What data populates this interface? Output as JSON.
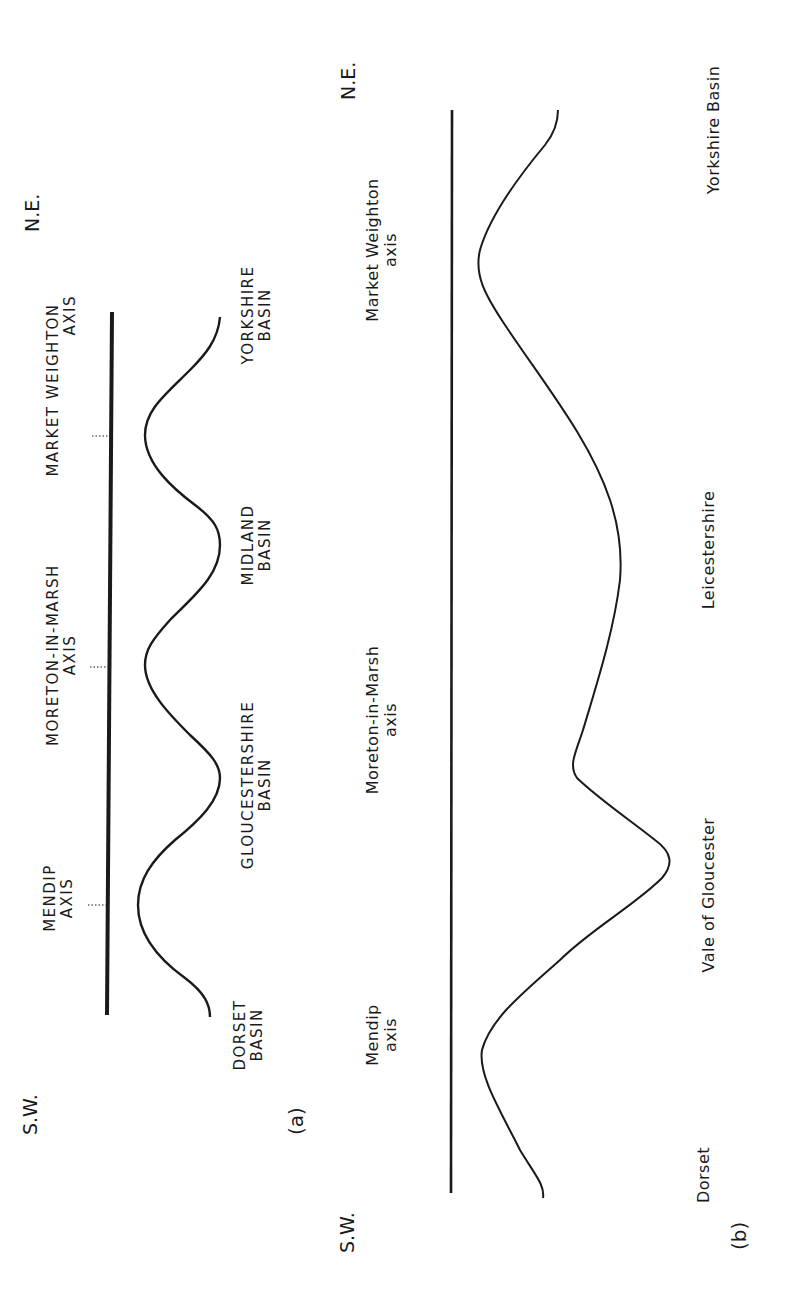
{
  "panel_a": {
    "label": "(a)",
    "sw": "S.W.",
    "ne": "N.E.",
    "axes": [
      {
        "line1": "MENDIP",
        "line2": "AXIS"
      },
      {
        "line1": "MORETON-IN-MARSH",
        "line2": "AXIS"
      },
      {
        "line1": "MARKET WEIGHTON",
        "line2": "AXIS"
      }
    ],
    "basins": [
      {
        "line1": "DORSET",
        "line2": "BASIN"
      },
      {
        "line1": "GLOUCESTERSHIRE",
        "line2": "BASIN"
      },
      {
        "line1": "MIDLAND",
        "line2": "BASIN"
      },
      {
        "line1": "YORKSHIRE",
        "line2": "BASIN"
      }
    ]
  },
  "panel_b": {
    "label": "(b)",
    "sw": "S.W.",
    "ne": "N.E.",
    "axes": [
      {
        "line1": "Mendip",
        "line2": "axis"
      },
      {
        "line1": "Moreton-in-Marsh",
        "line2": "axis"
      },
      {
        "line1": "Market Weighton",
        "line2": "axis"
      }
    ],
    "regions": [
      "Dorset",
      "Vale of Gloucester",
      "Leicestershire",
      "Yorkshire Basin"
    ]
  },
  "colors": {
    "ink": "#1a1a1a",
    "background": "#ffffff"
  }
}
